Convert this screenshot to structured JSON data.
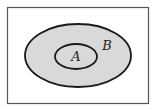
{
  "diagram": {
    "type": "venn",
    "universe": {
      "x": 7,
      "y": 7,
      "width": 142,
      "height": 97,
      "stroke": "#555555"
    },
    "sets": [
      {
        "label": "B",
        "cx": 78,
        "cy": 55.5,
        "rx": 53,
        "ry": 31.5,
        "fill": "#d9d9d9",
        "stroke": "#1a1a1a",
        "label_x": 107,
        "label_y": 50
      },
      {
        "label": "A",
        "cx": 76,
        "cy": 56.5,
        "rx": 21,
        "ry": 12.5,
        "fill": "#d9d9d9",
        "stroke": "#1a1a1a",
        "label_x": 76,
        "label_y": 61
      }
    ]
  }
}
